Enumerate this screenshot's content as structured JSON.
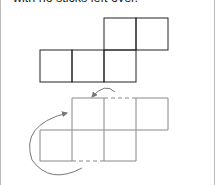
{
  "caption": "with no sticks left over.",
  "figures": [
    {
      "name": "original-shape",
      "squares": 5,
      "stroke": "#222222"
    },
    {
      "name": "moved-shape",
      "squares": 6,
      "stroke": "#888888",
      "dashed_edges": 2,
      "arrows": 2
    }
  ]
}
